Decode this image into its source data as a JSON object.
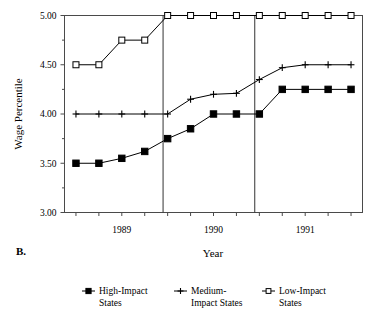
{
  "panel": {
    "label": "B."
  },
  "axes": {
    "ylabel": "Wage Percentile",
    "xlabel": "Year",
    "yticks": [
      "3.00",
      "3.50",
      "4.00",
      "4.50",
      "5.00"
    ],
    "xticks": [
      "1989",
      "1990",
      "1991"
    ]
  },
  "legend": {
    "items": [
      {
        "label_line1": "High-Impact",
        "label_line2": "States",
        "marker": "filled-square-marker"
      },
      {
        "label_line1": "Medium-",
        "label_line2": "Impact States",
        "marker": "plus-marker"
      },
      {
        "label_line1": "Low-Impact",
        "label_line2": "States",
        "marker": "open-square-marker"
      }
    ]
  },
  "chart_data": {
    "type": "line",
    "title": "",
    "xlabel": "Year",
    "ylabel": "Wage Percentile",
    "ylim": [
      3.0,
      5.0
    ],
    "yticks": [
      3.0,
      3.5,
      4.0,
      4.5,
      5.0
    ],
    "minor_yticks": [
      3.25,
      3.75,
      4.25,
      4.75
    ],
    "xlim": [
      0,
      13
    ],
    "x": [
      0.5,
      1.5,
      2.5,
      3.5,
      4.5,
      5.5,
      6.5,
      7.5,
      8.5,
      9.5,
      10.5,
      11.5,
      12.5
    ],
    "xtick_labels": [
      "1989",
      "1990",
      "1991"
    ],
    "xtick_positions": [
      2.5,
      6.5,
      10.5
    ],
    "grid": false,
    "legend_position": "bottom",
    "vertical_reference_lines": [
      4.3,
      8.3
    ],
    "series": [
      {
        "name": "High-Impact States",
        "marker": "filled-square",
        "values": [
          3.5,
          3.5,
          3.55,
          3.62,
          3.75,
          3.85,
          4.0,
          4.0,
          4.0,
          4.25,
          4.25,
          4.25,
          4.25
        ]
      },
      {
        "name": "Medium-Impact States",
        "marker": "plus",
        "values": [
          4.0,
          4.0,
          4.0,
          4.0,
          4.0,
          4.15,
          4.2,
          4.21,
          4.35,
          4.47,
          4.5,
          4.5,
          4.5
        ]
      },
      {
        "name": "Low-Impact States",
        "marker": "open-square",
        "values": [
          4.5,
          4.5,
          4.75,
          4.75,
          5.0,
          5.0,
          5.0,
          5.0,
          5.0,
          5.0,
          5.0,
          5.0,
          5.0
        ]
      }
    ]
  }
}
